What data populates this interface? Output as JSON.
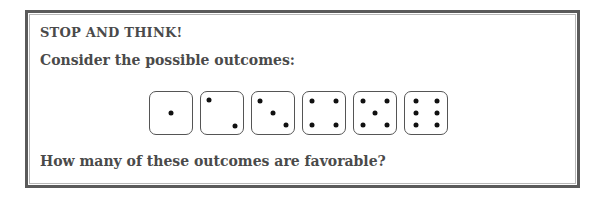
{
  "box": {
    "heading": "STOP AND THINK!",
    "prompt": "Consider the possible outcomes:",
    "question": "How many of these outcomes are favorable?"
  },
  "dice": [
    {
      "face": 1,
      "pips": [
        [
          50,
          50
        ]
      ]
    },
    {
      "face": 2,
      "pips": [
        [
          20,
          20
        ],
        [
          80,
          80
        ]
      ]
    },
    {
      "face": 3,
      "pips": [
        [
          20,
          22
        ],
        [
          50,
          50
        ],
        [
          80,
          78
        ]
      ]
    },
    {
      "face": 4,
      "pips": [
        [
          22,
          22
        ],
        [
          78,
          22
        ],
        [
          22,
          78
        ],
        [
          78,
          78
        ]
      ]
    },
    {
      "face": 5,
      "pips": [
        [
          22,
          22
        ],
        [
          78,
          22
        ],
        [
          50,
          50
        ],
        [
          22,
          78
        ],
        [
          78,
          78
        ]
      ]
    },
    {
      "face": 6,
      "pips": [
        [
          25,
          22
        ],
        [
          75,
          22
        ],
        [
          25,
          50
        ],
        [
          75,
          50
        ],
        [
          25,
          78
        ],
        [
          75,
          78
        ]
      ]
    }
  ],
  "colors": {
    "frame": "#5a5a5a",
    "text": "#4a4a4a",
    "pip": "#111111"
  }
}
